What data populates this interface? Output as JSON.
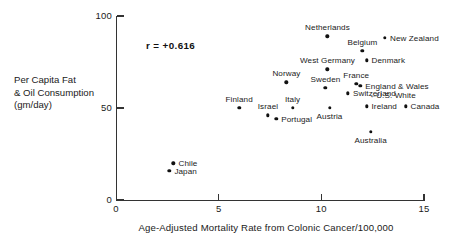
{
  "chart_data": {
    "type": "scatter",
    "title": "",
    "xlabel": "Age-Adjusted Mortality Rate from Colonic Cancer/100,000",
    "ylabel": "Per Capita Fat\n& Oil Consumption\n(gm/day)",
    "xlim": [
      0,
      15
    ],
    "ylim": [
      0,
      100
    ],
    "xticks": [
      "0",
      "5",
      "10",
      "15"
    ],
    "xtick_values": [
      0,
      5,
      10,
      15
    ],
    "yticks": [
      "0",
      "50",
      "100"
    ],
    "ytick_values": [
      0,
      50,
      100
    ],
    "grid": false,
    "legend": "none",
    "annotation": "r = +0.616",
    "correlation": 0.616,
    "points": [
      {
        "label": "Netherlands",
        "x": 10.3,
        "y": 89,
        "label_pos": "above"
      },
      {
        "label": "New Zealand",
        "x": 13.1,
        "y": 88,
        "label_pos": "right"
      },
      {
        "label": "Belgium",
        "x": 12.0,
        "y": 81,
        "label_pos": "above"
      },
      {
        "label": "Denmark",
        "x": 12.2,
        "y": 76,
        "label_pos": "right"
      },
      {
        "label": "West Germany",
        "x": 10.3,
        "y": 71,
        "label_pos": "above"
      },
      {
        "label": "Norway",
        "x": 8.3,
        "y": 64,
        "label_pos": "above"
      },
      {
        "label": "France",
        "x": 11.7,
        "y": 63,
        "label_pos": "above"
      },
      {
        "label": "England & Wales",
        "x": 11.9,
        "y": 62,
        "label_pos": "right"
      },
      {
        "label": "Sweden",
        "x": 10.2,
        "y": 61,
        "label_pos": "above"
      },
      {
        "label": "Switzerland",
        "x": 11.3,
        "y": 58,
        "label_pos": "right"
      },
      {
        "label": "U.S. White",
        "x": 13.4,
        "y": 57,
        "label_pos": "arrow-right"
      },
      {
        "label": "Canada",
        "x": 14.1,
        "y": 51,
        "label_pos": "right"
      },
      {
        "label": "Ireland",
        "x": 12.2,
        "y": 51,
        "label_pos": "right"
      },
      {
        "label": "Italy",
        "x": 8.6,
        "y": 50,
        "label_pos": "above"
      },
      {
        "label": "Austria",
        "x": 10.4,
        "y": 50,
        "label_pos": "below"
      },
      {
        "label": "Finland",
        "x": 6.0,
        "y": 50,
        "label_pos": "above"
      },
      {
        "label": "Israel",
        "x": 7.4,
        "y": 46,
        "label_pos": "above"
      },
      {
        "label": "Portugal",
        "x": 7.8,
        "y": 44,
        "label_pos": "right"
      },
      {
        "label": "Australia",
        "x": 12.4,
        "y": 37,
        "label_pos": "below"
      },
      {
        "label": "Chile",
        "x": 2.8,
        "y": 20,
        "label_pos": "right"
      },
      {
        "label": "Japan",
        "x": 2.6,
        "y": 16,
        "label_pos": "right"
      }
    ]
  },
  "colors": {
    "marker": "#111111",
    "axis": "#333333",
    "text": "#1a1a1a",
    "background": "#ffffff"
  },
  "icons": {
    "arrow_left": "←"
  }
}
